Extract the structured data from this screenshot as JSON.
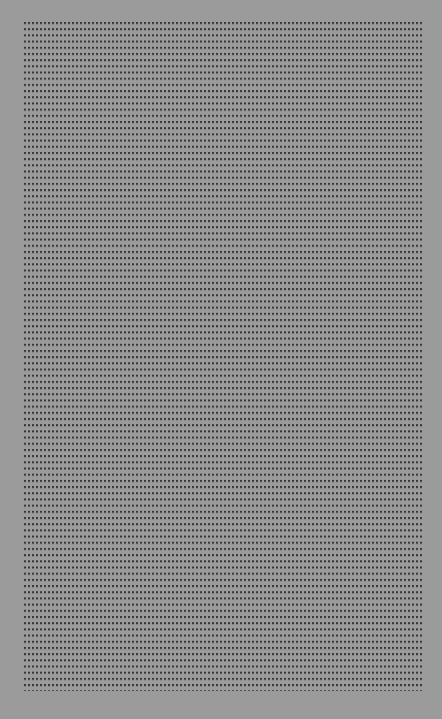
{
  "canvas": {
    "width": 442,
    "height": 719,
    "background_color": "#9b9b9b"
  },
  "dot_grid": {
    "dot_color": "#2b2b2b",
    "left": 24,
    "top": 22,
    "right": 422,
    "bottom": 691,
    "pitch_x": 4,
    "pitch_y": 6.2,
    "dot_size": 2,
    "approx_columns": 100,
    "approx_rows": 108
  }
}
